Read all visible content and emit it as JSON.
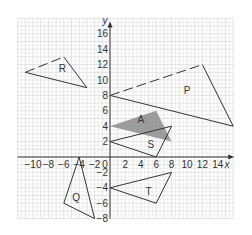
{
  "diagram": {
    "type": "coordinate-grid-transformations",
    "axes": {
      "x_label": "x",
      "y_label": "y",
      "x_range": [
        -12,
        16
      ],
      "y_range": [
        -8,
        18
      ],
      "x_ticks": [
        -10,
        -8,
        -6,
        -4,
        -2,
        2,
        4,
        6,
        8,
        10,
        12,
        14
      ],
      "x_tick_labels": [
        "−10",
        "−8",
        "−6",
        "−4",
        "−2",
        "2",
        "4",
        "6",
        "8",
        "10",
        "12",
        "14"
      ],
      "y_ticks": [
        16,
        14,
        12,
        10,
        8,
        6,
        4,
        2,
        -2,
        -4,
        -6,
        -8
      ],
      "y_tick_labels": [
        "16",
        "14",
        "12",
        "10",
        "8",
        "6",
        "4",
        "2",
        "−2",
        "−4",
        "−6",
        "−8"
      ],
      "origin_label": "0"
    },
    "colors": {
      "grid": "#d9d9d9",
      "axis": "#333333",
      "shape_stroke": "#333333",
      "shaded_fill": "#8c8c8c",
      "background": "#ffffff"
    },
    "shapes": [
      {
        "id": "A",
        "label": "A",
        "vertices": [
          [
            0,
            4
          ],
          [
            6,
            6
          ],
          [
            8,
            2
          ]
        ],
        "shaded": true,
        "label_pos": [
          4,
          4.4
        ]
      },
      {
        "id": "P",
        "label": "P",
        "vertices": [
          [
            0,
            8
          ],
          [
            12,
            12
          ],
          [
            16,
            4
          ]
        ],
        "shaded": false,
        "dashed_edge": [
          0,
          1
        ],
        "label_pos": [
          10,
          8.2
        ]
      },
      {
        "id": "R",
        "label": "R",
        "vertices": [
          [
            -11,
            11
          ],
          [
            -6,
            13
          ],
          [
            -3,
            9
          ]
        ],
        "shaded": false,
        "dashed_edge": [
          0,
          1
        ],
        "label_pos": [
          -6.2,
          11
        ]
      },
      {
        "id": "S",
        "label": "S",
        "vertices": [
          [
            0,
            2
          ],
          [
            8,
            4
          ],
          [
            6,
            0
          ]
        ],
        "shaded": false,
        "label_pos": [
          5.3,
          1.2
        ]
      },
      {
        "id": "T",
        "label": "T",
        "vertices": [
          [
            0,
            -4
          ],
          [
            8,
            -2
          ],
          [
            6,
            -6
          ]
        ],
        "shaded": false,
        "label_pos": [
          5,
          -4.9
        ]
      },
      {
        "id": "Q",
        "label": "Q",
        "vertices": [
          [
            -4,
            0
          ],
          [
            -6,
            -6
          ],
          [
            -2,
            -8
          ]
        ],
        "shaded": false,
        "label_pos": [
          -4.4,
          -5.7
        ]
      }
    ]
  }
}
